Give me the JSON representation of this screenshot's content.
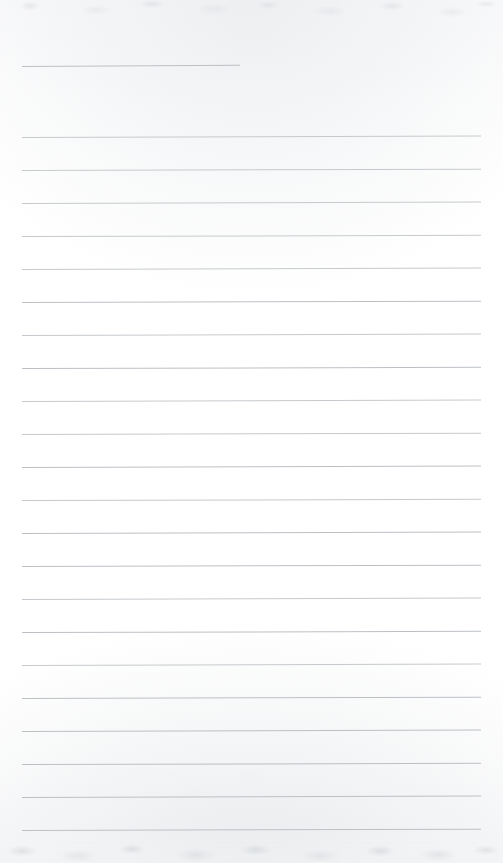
{
  "document": {
    "kind": "scanned-lined-notepad-page",
    "page_label": "",
    "width_px": 503,
    "height_px": 863,
    "paper_color": "#fdfdfd",
    "rule_color": "#c6cace",
    "rule_color_strong": "#b9bdc2",
    "has_handwriting": false,
    "has_printed_text": false,
    "body_text": ""
  },
  "rules": {
    "title_rule": {
      "name": "title-rule",
      "x": 22,
      "y": 66,
      "width": 218,
      "tilt_deg": -0.35,
      "strong": true
    },
    "left_margin_x": 22,
    "right_edge_x": 481,
    "line_spacing_px": 33,
    "body_lines": [
      {
        "y": 137,
        "x": 22,
        "width": 459,
        "tilt_deg": -0.18,
        "strong": false
      },
      {
        "y": 170,
        "x": 22,
        "width": 459,
        "tilt_deg": -0.16,
        "strong": false
      },
      {
        "y": 203,
        "x": 22,
        "width": 459,
        "tilt_deg": -0.18,
        "strong": false
      },
      {
        "y": 236,
        "x": 22,
        "width": 459,
        "tilt_deg": -0.15,
        "strong": false
      },
      {
        "y": 269,
        "x": 22,
        "width": 459,
        "tilt_deg": -0.18,
        "strong": false
      },
      {
        "y": 302,
        "x": 22,
        "width": 459,
        "tilt_deg": -0.16,
        "strong": true
      },
      {
        "y": 335,
        "x": 22,
        "width": 459,
        "tilt_deg": -0.18,
        "strong": false
      },
      {
        "y": 368,
        "x": 22,
        "width": 459,
        "tilt_deg": -0.15,
        "strong": true
      },
      {
        "y": 401,
        "x": 22,
        "width": 459,
        "tilt_deg": -0.18,
        "strong": false
      },
      {
        "y": 434,
        "x": 22,
        "width": 459,
        "tilt_deg": -0.16,
        "strong": false
      },
      {
        "y": 467,
        "x": 22,
        "width": 459,
        "tilt_deg": -0.18,
        "strong": true
      },
      {
        "y": 500,
        "x": 22,
        "width": 459,
        "tilt_deg": -0.15,
        "strong": false
      },
      {
        "y": 533,
        "x": 22,
        "width": 459,
        "tilt_deg": -0.18,
        "strong": true
      },
      {
        "y": 566,
        "x": 22,
        "width": 459,
        "tilt_deg": -0.16,
        "strong": true
      },
      {
        "y": 599,
        "x": 22,
        "width": 459,
        "tilt_deg": -0.18,
        "strong": false
      },
      {
        "y": 632,
        "x": 22,
        "width": 459,
        "tilt_deg": -0.15,
        "strong": true
      },
      {
        "y": 665,
        "x": 22,
        "width": 459,
        "tilt_deg": -0.18,
        "strong": false
      },
      {
        "y": 698,
        "x": 22,
        "width": 459,
        "tilt_deg": -0.16,
        "strong": true
      },
      {
        "y": 731,
        "x": 22,
        "width": 459,
        "tilt_deg": -0.18,
        "strong": true
      },
      {
        "y": 764,
        "x": 22,
        "width": 459,
        "tilt_deg": -0.15,
        "strong": true
      },
      {
        "y": 797,
        "x": 22,
        "width": 459,
        "tilt_deg": -0.18,
        "strong": true
      },
      {
        "y": 830,
        "x": 22,
        "width": 459,
        "tilt_deg": -0.16,
        "strong": true
      }
    ]
  }
}
